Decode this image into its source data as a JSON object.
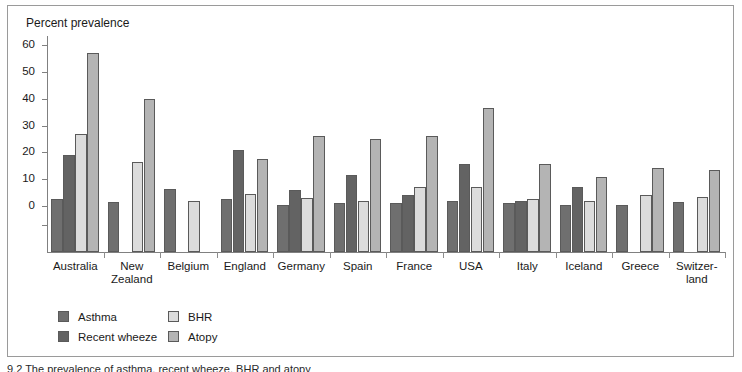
{
  "figure": {
    "background": "#ffffff",
    "frame_color": "#9a9a9a",
    "caption": "9.2 The prevalence of asthma, recent wheeze, BHR and atopy"
  },
  "chart_data": {
    "type": "bar",
    "title": "Percent prevalence",
    "ylabel": "Percent prevalence",
    "xlabel": "",
    "grid": false,
    "legend_position": "bottom-left",
    "ylim": [
      0,
      60
    ],
    "yticks": [
      0,
      10,
      20,
      30,
      40,
      50,
      60
    ],
    "ytick_labels": [
      "0",
      "10",
      "20",
      "30",
      "40",
      "50",
      "60"
    ],
    "note": "Bars are drawn from a baseline below the zero line; all values are positive percentages.",
    "categories": [
      "Australia",
      "New\nZealand",
      "Belgium",
      "England",
      "Germany",
      "Spain",
      "France",
      "USA",
      "Italy",
      "Iceland",
      "Greece",
      "Switzer-\nland"
    ],
    "series": [
      {
        "name": "Asthma",
        "color": "#6f6f6f",
        "values": [
          2.5,
          1.5,
          6.5,
          2.5,
          0.5,
          1.0,
          1.0,
          2.0,
          1.0,
          0.5,
          0.5,
          1.5
        ]
      },
      {
        "name": "Recent wheeze",
        "color": "#636363",
        "values": [
          19.0,
          null,
          null,
          21.0,
          6.0,
          11.5,
          4.0,
          15.5,
          2.0,
          7.0,
          null,
          null
        ]
      },
      {
        "name": "BHR",
        "color": "#dcdcdc",
        "values": [
          27.0,
          16.5,
          2.0,
          4.5,
          3.0,
          2.0,
          7.0,
          7.0,
          2.5,
          2.0,
          4.0,
          3.5
        ]
      },
      {
        "name": "Atopy",
        "color": "#b4b4b4",
        "values": [
          57.0,
          40.0,
          null,
          17.5,
          26.0,
          25.0,
          26.0,
          36.5,
          15.5,
          11.0,
          14.0,
          13.5
        ]
      }
    ]
  },
  "legend": {
    "column_1": [
      "Asthma",
      "Recent wheeze"
    ],
    "column_2": [
      "BHR",
      "Atopy"
    ]
  }
}
